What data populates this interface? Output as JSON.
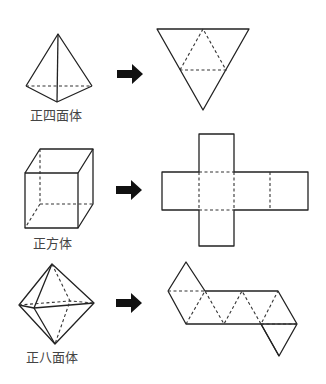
{
  "figure": {
    "rows": [
      {
        "solid_name": "正四面体",
        "net_description": "tetrahedron net (4 triangles)"
      },
      {
        "solid_name": "正方体",
        "net_description": "cube net (cross, 6 squares)"
      },
      {
        "solid_name": "正八面体",
        "net_description": "octahedron net (8 triangles)"
      }
    ],
    "arrow_icon": "right-arrow"
  }
}
